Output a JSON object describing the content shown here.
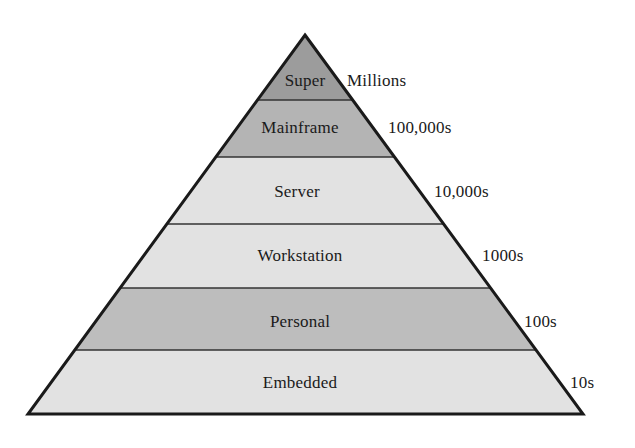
{
  "diagram": {
    "type": "pyramid",
    "orientation": "apex-top",
    "geometry": {
      "apex_x": 305,
      "apex_y": 35,
      "base_left_x": 28,
      "base_right_x": 583,
      "base_y": 414,
      "outline_color": "#1a1a1a",
      "outline_width": 3,
      "divider_color": "#333333",
      "divider_width": 1.6,
      "background": "#ffffff"
    },
    "levels": [
      {
        "name": "Super",
        "label": "Super",
        "scale_label": "Millions",
        "fill": "#9c9c9c",
        "top_y": 35,
        "bottom_y": 100,
        "label_x": 305,
        "label_y": 81,
        "scale_x": 347,
        "scale_y": 81
      },
      {
        "name": "Mainframe",
        "label": "Mainframe",
        "scale_label": "100,000s",
        "fill": "#b4b4b4",
        "top_y": 100,
        "bottom_y": 157,
        "label_x": 300,
        "label_y": 128,
        "scale_x": 388,
        "scale_y": 128
      },
      {
        "name": "Server",
        "label": "Server",
        "scale_label": "10,000s",
        "fill": "#e2e2e2",
        "top_y": 157,
        "bottom_y": 224,
        "label_x": 297,
        "label_y": 192,
        "scale_x": 434,
        "scale_y": 192
      },
      {
        "name": "Workstation",
        "label": "Workstation",
        "scale_label": "1000s",
        "fill": "#e2e2e2",
        "top_y": 224,
        "bottom_y": 288,
        "label_x": 300,
        "label_y": 256,
        "scale_x": 482,
        "scale_y": 256
      },
      {
        "name": "Personal",
        "label": "Personal",
        "scale_label": "100s",
        "fill": "#bdbdbd",
        "top_y": 288,
        "bottom_y": 350,
        "label_x": 300,
        "label_y": 322,
        "scale_x": 524,
        "scale_y": 322
      },
      {
        "name": "Embedded",
        "label": "Embedded",
        "scale_label": "10s",
        "fill": "#e2e2e2",
        "top_y": 350,
        "bottom_y": 414,
        "label_x": 300,
        "label_y": 383,
        "scale_x": 570,
        "scale_y": 383
      }
    ]
  }
}
